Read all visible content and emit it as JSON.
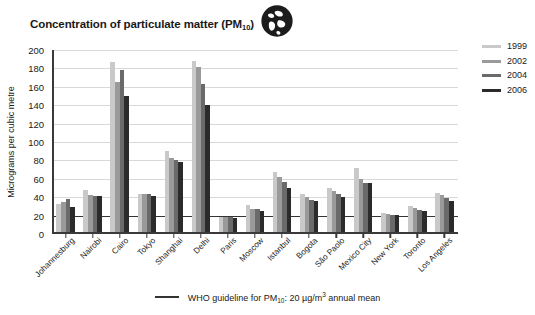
{
  "chart_data": {
    "type": "bar",
    "title": "Concentration of particulate matter (PM10)",
    "title_main": "Concentration of particulate matter (PM",
    "title_sub": "10",
    "title_tail": ")",
    "xlabel": "",
    "ylabel": "Micrograms per cubic metre",
    "ylim": [
      0,
      200
    ],
    "ytick_step": 20,
    "yticks": [
      200,
      180,
      160,
      140,
      120,
      100,
      80,
      60,
      40,
      20,
      0
    ],
    "grid": true,
    "legend_position": "right",
    "categories": [
      "Johannesburg",
      "Nairobi",
      "Cairo",
      "Tokyo",
      "Shanghai",
      "Delhi",
      "Paris",
      "Moscow",
      "Istanbul",
      "Bogota",
      "São Paolo",
      "Mexico City",
      "New York",
      "Toronto",
      "Los Angeles"
    ],
    "series": [
      {
        "name": "1999",
        "color": "#c9c9c9",
        "values": [
          33,
          48,
          187,
          44,
          90,
          188,
          19,
          32,
          67,
          43,
          50,
          72,
          23,
          30,
          45
        ]
      },
      {
        "name": "2002",
        "color": "#9a9a9a",
        "values": [
          35,
          42,
          165,
          43,
          83,
          182,
          18,
          27,
          62,
          40,
          47,
          60,
          22,
          28,
          42
        ]
      },
      {
        "name": "2004",
        "color": "#6a6a6a",
        "values": [
          38,
          41,
          178,
          43,
          80,
          163,
          18,
          27,
          56,
          37,
          43,
          55,
          21,
          26,
          39
        ]
      },
      {
        "name": "2006",
        "color": "#2b2b2b",
        "values": [
          29,
          41,
          150,
          41,
          78,
          140,
          17,
          25,
          50,
          36,
          40,
          55,
          21,
          25,
          36
        ]
      }
    ],
    "reference_line": {
      "value": 20,
      "label_rule": "—",
      "label_main": "WHO guideline for PM",
      "label_sub": "10",
      "label_tail": ": 20 µg/m",
      "label_sup": "3",
      "label_end": " annual mean",
      "color": "#333333"
    },
    "icons": {
      "globe": "globe-icon"
    }
  }
}
